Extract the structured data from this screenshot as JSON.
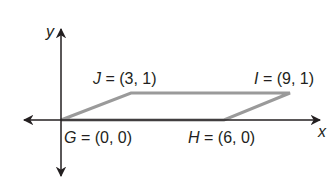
{
  "diagram": {
    "type": "coordinate-plane-parallelogram",
    "axes": {
      "x_label": "x",
      "y_label": "y"
    },
    "vertices": [
      {
        "name": "G",
        "eq": " = (0, 0)",
        "x": 0,
        "y": 0
      },
      {
        "name": "H",
        "eq": " = (6, 0)",
        "x": 6,
        "y": 0
      },
      {
        "name": "I",
        "eq": " = (9, 1)",
        "x": 9,
        "y": 1
      },
      {
        "name": "J",
        "eq": " = (3, 1)",
        "x": 3,
        "y": 1
      }
    ],
    "colors": {
      "axis": "#231f20",
      "shape": "#9a9a9a",
      "text": "#231f20"
    }
  }
}
